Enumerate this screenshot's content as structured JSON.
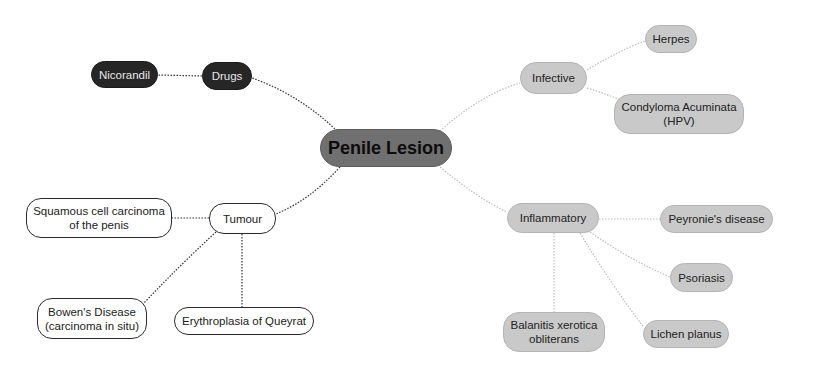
{
  "diagram": {
    "type": "mind-map",
    "root": {
      "id": "root",
      "label": "Penile Lesion",
      "style": "root",
      "box": [
        320,
        129,
        132,
        38
      ]
    },
    "nodes": [
      {
        "id": "drugs",
        "label": "Drugs",
        "style": "dark",
        "box": [
          202,
          62,
          50,
          28
        ]
      },
      {
        "id": "nicorandil",
        "label": "Nicorandil",
        "style": "dark",
        "box": [
          91,
          61,
          67,
          27
        ]
      },
      {
        "id": "infective",
        "label": "Infective",
        "style": "light",
        "box": [
          520,
          62,
          67,
          32
        ]
      },
      {
        "id": "herpes",
        "label": "Herpes",
        "style": "light",
        "box": [
          645,
          25,
          52,
          28
        ]
      },
      {
        "id": "condyloma",
        "label": "Condyloma Acuminata\n(HPV)",
        "style": "light",
        "box": [
          614,
          94,
          130,
          40
        ]
      },
      {
        "id": "inflammatory",
        "label": "Inflammatory",
        "style": "light",
        "box": [
          507,
          203,
          92,
          30
        ]
      },
      {
        "id": "peyronie",
        "label": "Peyronie's disease",
        "style": "light",
        "box": [
          660,
          205,
          113,
          28
        ]
      },
      {
        "id": "psoriasis",
        "label": "Psoriasis",
        "style": "light",
        "box": [
          670,
          263,
          63,
          29
        ]
      },
      {
        "id": "lichen",
        "label": "Lichen planus",
        "style": "light",
        "box": [
          643,
          320,
          86,
          28
        ]
      },
      {
        "id": "balanitis",
        "label": "Balanitis xerotica\nobliterans",
        "style": "light",
        "box": [
          503,
          312,
          102,
          40
        ]
      },
      {
        "id": "tumour",
        "label": "Tumour",
        "style": "white",
        "box": [
          209,
          203,
          67,
          31
        ]
      },
      {
        "id": "squamous",
        "label": "Squamous cell carcinoma\nof the penis",
        "style": "white",
        "box": [
          26,
          198,
          146,
          40
        ]
      },
      {
        "id": "bowen",
        "label": "Bowen's Disease\n(carcinoma in situ)",
        "style": "white",
        "box": [
          37,
          298,
          110,
          41
        ]
      },
      {
        "id": "erythroplasia",
        "label": "Erythroplasia of Queyrat",
        "style": "white",
        "box": [
          174,
          307,
          140,
          28
        ]
      }
    ],
    "edges": [
      {
        "path": "M337,131 Q300,95 252,78",
        "color": "#333333"
      },
      {
        "path": "M202,76 L158,75",
        "color": "#333333"
      },
      {
        "path": "M440,131 Q480,95 520,83",
        "color": "#bdbdbd"
      },
      {
        "path": "M587,70 Q620,50 645,41",
        "color": "#bdbdbd"
      },
      {
        "path": "M587,88 Q610,95 620,100",
        "color": "#bdbdbd"
      },
      {
        "path": "M440,167 Q480,200 507,212",
        "color": "#bdbdbd"
      },
      {
        "path": "M599,219 L660,219",
        "color": "#bdbdbd"
      },
      {
        "path": "M590,232 Q630,260 670,277",
        "color": "#bdbdbd"
      },
      {
        "path": "M580,233 Q615,290 643,326",
        "color": "#bdbdbd"
      },
      {
        "path": "M554,233 L554,312",
        "color": "#bdbdbd"
      },
      {
        "path": "M340,167 Q310,200 276,214",
        "color": "#333333"
      },
      {
        "path": "M209,218 L172,218",
        "color": "#333333"
      },
      {
        "path": "M242,234 L242,307",
        "color": "#333333"
      },
      {
        "path": "M216,232 Q180,265 144,303",
        "color": "#333333"
      }
    ]
  }
}
